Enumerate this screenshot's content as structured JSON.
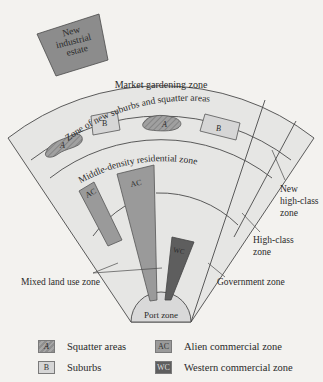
{
  "diagram": {
    "title": "",
    "zones": {
      "industrial": "New industrial estate",
      "industrial_lines": [
        "New",
        "industrial",
        "estate"
      ],
      "market": "Market gardening zone",
      "suburbs": "Zone of new suburbs and squatter areas",
      "middle": "Middle-density residential zone",
      "new_high_class_lines": [
        "New",
        "high-class",
        "zone"
      ],
      "high_class_lines": [
        "High-class",
        "zone"
      ],
      "mixed": "Mixed land use zone",
      "government": "Government zone",
      "port": "Port zone"
    },
    "shape_labels": {
      "squatter": "A",
      "suburb": "B",
      "alien": "AC",
      "western": "WC"
    }
  },
  "legend": {
    "items": [
      {
        "key": "A",
        "label": "Squatter areas",
        "color": "#999999"
      },
      {
        "key": "B",
        "label": "Suburbs",
        "color": "#d6d6d6"
      },
      {
        "key": "AC",
        "label": "Alien commercial zone",
        "color": "#9a9a9a"
      },
      {
        "key": "WC",
        "label": "Western commercial zone",
        "color": "#5e5e5e"
      }
    ]
  },
  "colors": {
    "background": "#f3f2ef",
    "zone_fill": "#e6e6e4",
    "port_fill": "#d9d9d9",
    "industrial_fill": "#8c8c8c",
    "line": "#4a4a4a"
  }
}
